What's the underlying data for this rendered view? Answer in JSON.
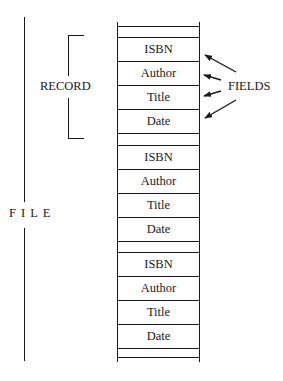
{
  "diagram": {
    "file_label": "F I L E",
    "record_label": "RECORD",
    "fields_label": "FIELDS",
    "records": [
      {
        "fields": [
          "ISBN",
          "Author",
          "Title",
          "Date"
        ]
      },
      {
        "fields": [
          "ISBN",
          "Author",
          "Title",
          "Date"
        ]
      },
      {
        "fields": [
          "ISBN",
          "Author",
          "Title",
          "Date"
        ]
      }
    ]
  }
}
